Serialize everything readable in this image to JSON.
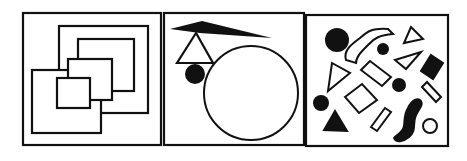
{
  "figure": {
    "stroke_color": "#111111",
    "background": "#ffffff",
    "panels": [
      {
        "id": "panel-1",
        "label": "Nested overlapping squares",
        "shapes": [
          "outer-square",
          "large-square",
          "medium-square",
          "small-square-a",
          "small-square-b",
          "front-square"
        ]
      },
      {
        "id": "panel-2",
        "label": "Stacked shapes: black wedge, outline triangle, black dot, large circle",
        "shapes": [
          "black-wedge",
          "outline-triangle",
          "black-dot",
          "large-circle"
        ]
      },
      {
        "id": "panel-3",
        "label": "Scattered shapes",
        "shapes": [
          "black-circle",
          "outline-squiggle",
          "black-dot",
          "outline-triangle",
          "outline-triangle",
          "black-diamond",
          "outline-rectangle",
          "outline-triangle",
          "black-dot",
          "outline-rectangle",
          "outline-diamond",
          "black-dot",
          "black-triangle",
          "outline-rectangle",
          "black-squiggle",
          "outline-circle"
        ]
      }
    ]
  }
}
